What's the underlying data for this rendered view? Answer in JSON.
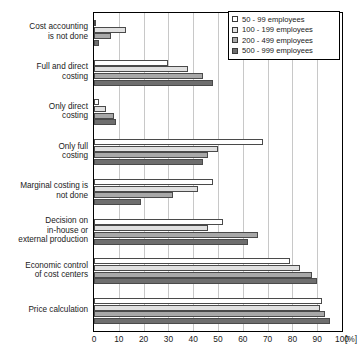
{
  "chart_data": {
    "type": "bar",
    "orientation": "horizontal",
    "title": "",
    "xlabel": "[%]",
    "ylabel": "",
    "xlim": [
      0,
      100
    ],
    "xticks": [
      0,
      10,
      20,
      30,
      40,
      50,
      60,
      70,
      80,
      90,
      100
    ],
    "grid": true,
    "legend_position": "top-right",
    "categories": [
      "Cost accounting\nis not done",
      "Full and direct\ncosting",
      "Only direct\ncosting",
      "Only full\ncosting",
      "Marginal costing is\nnot done",
      "Decision on\nin-house or\nexternal production",
      "Economic control\nof cost centers",
      "Price calculation"
    ],
    "series": [
      {
        "name": "50 - 99 employees",
        "color": "#ffffff",
        "values": [
          0,
          30,
          2,
          68,
          48,
          52,
          79,
          92
        ]
      },
      {
        "name": "100 - 199 employees",
        "color": "#e0e0e0",
        "values": [
          13,
          38,
          5,
          50,
          42,
          46,
          83,
          91
        ]
      },
      {
        "name": "200 - 499 employees",
        "color": "#a8a8a8",
        "values": [
          7,
          44,
          8,
          46,
          32,
          66,
          88,
          93
        ]
      },
      {
        "name": "500 - 999 employees",
        "color": "#6e6e6e",
        "values": [
          2,
          48,
          9,
          44,
          19,
          62,
          90,
          95
        ]
      }
    ]
  },
  "axis": {
    "tick_labels": [
      "0",
      "10",
      "20",
      "30",
      "40",
      "50",
      "60",
      "70",
      "80",
      "90",
      "100"
    ],
    "unit_label": "[%]"
  },
  "legend": {
    "items": [
      {
        "label": "50 -   99 employees"
      },
      {
        "label": "100 - 199 employees"
      },
      {
        "label": "200 - 499 employees"
      },
      {
        "label": "500 - 999 employees"
      }
    ]
  },
  "categories_display": [
    {
      "lines": [
        "Cost accounting",
        "is not done"
      ]
    },
    {
      "lines": [
        "Full and direct",
        "costing"
      ]
    },
    {
      "lines": [
        "Only direct",
        "costing"
      ]
    },
    {
      "lines": [
        "Only full",
        "costing"
      ]
    },
    {
      "lines": [
        "Marginal costing is",
        "not done"
      ]
    },
    {
      "lines": [
        "Decision on",
        "in-house or",
        "external production"
      ]
    },
    {
      "lines": [
        "Economic control",
        "of cost centers"
      ]
    },
    {
      "lines": [
        "Price calculation"
      ]
    }
  ]
}
